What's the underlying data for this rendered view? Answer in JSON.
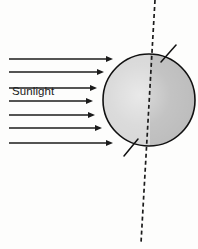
{
  "figure": {
    "width": 198,
    "height": 249,
    "background_color": "#fdfdfc"
  },
  "labels": {
    "sunlight": "Sunlight",
    "ghost_text_top": "",
    "ghost_text_second": ""
  },
  "colors": {
    "ink": "#1b1b1b",
    "outline": "#111111",
    "day_side": "#d7d7d7",
    "night_side": "#bdbdbd",
    "axis_dash": "#1b1b1b",
    "ghost": "#f3f3f3"
  },
  "sphere": {
    "name": "earth",
    "center_x": 149,
    "center_y": 100,
    "radius": 46,
    "terminator_x": 150,
    "day_side_label": "lit half",
    "night_side_label": "dark half",
    "outline_width": 1.6
  },
  "axis": {
    "name": "rotation-axis",
    "style": "dashed",
    "top_x": 155,
    "top_y": 0,
    "bottom_x": 141,
    "bottom_y": 243,
    "dash_pattern": "4 3",
    "stroke_width": 1.7
  },
  "axis_ticks": [
    {
      "name": "north-pole-tick",
      "x1": 161,
      "y1": 62,
      "x2": 176,
      "y2": 45
    },
    {
      "name": "south-pole-tick",
      "x1": 138,
      "y1": 139,
      "x2": 124,
      "y2": 156
    }
  ],
  "arrows": {
    "count": 7,
    "direction": "right",
    "start_x": 9,
    "stroke_width": 1.6,
    "head_length": 7,
    "head_width": 6,
    "rays": [
      {
        "name": "sunlight-ray-1",
        "y": 59,
        "tip_x": 113
      },
      {
        "name": "sunlight-ray-2",
        "y": 72,
        "tip_x": 104
      },
      {
        "name": "sunlight-ray-3",
        "y": 88,
        "tip_x": 97
      },
      {
        "name": "sunlight-ray-4",
        "y": 101,
        "tip_x": 93
      },
      {
        "name": "sunlight-ray-5",
        "y": 115,
        "tip_x": 95
      },
      {
        "name": "sunlight-ray-6",
        "y": 128,
        "tip_x": 102
      },
      {
        "name": "sunlight-ray-7",
        "y": 143,
        "tip_x": 113
      }
    ]
  }
}
